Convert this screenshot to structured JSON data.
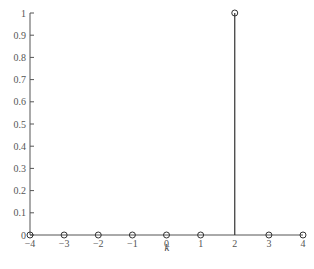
{
  "chart_data": {
    "type": "stem",
    "title": "",
    "xlabel": "k",
    "ylabel": "",
    "x": [
      -4,
      -3,
      -2,
      -1,
      0,
      1,
      2,
      3,
      4
    ],
    "values": [
      0,
      0,
      0,
      0,
      0,
      0,
      1,
      0,
      0
    ],
    "xlim": [
      -4,
      4
    ],
    "ylim": [
      0,
      1
    ],
    "xticks": [
      -4,
      -3,
      -2,
      -1,
      0,
      1,
      2,
      3,
      4
    ],
    "xtick_labels": [
      "−4",
      "−3",
      "−2",
      "−1",
      "0",
      "1",
      "2",
      "3",
      "4"
    ],
    "yticks": [
      0,
      0.1,
      0.2,
      0.3,
      0.4,
      0.5,
      0.6,
      0.7,
      0.8,
      0.9,
      1
    ],
    "ytick_labels": [
      "0",
      "0.1",
      "0.2",
      "0.3",
      "0.4",
      "0.5",
      "0.6",
      "0.7",
      "0.8",
      "0.9",
      "1"
    ],
    "marker": "open-circle",
    "grid": false,
    "legend": null,
    "colors": {
      "stem": "#333333",
      "axis": "#555555",
      "marker": "#333333"
    }
  }
}
